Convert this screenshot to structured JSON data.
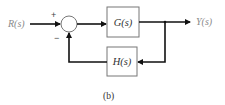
{
  "diagram": {
    "type": "feedback-control-block-diagram",
    "input_label": "R(s)",
    "output_label": "Y(s)",
    "summing_junction": {
      "plus_sign": "+",
      "minus_sign": "−"
    },
    "forward_block": {
      "label": "G(s)"
    },
    "feedback_block": {
      "label": "H(s)"
    },
    "caption": "(b)",
    "colors": {
      "line": "#111111",
      "box_border": "#777777",
      "signal_label": "#8a8a8a",
      "block_text": "#333333"
    }
  }
}
